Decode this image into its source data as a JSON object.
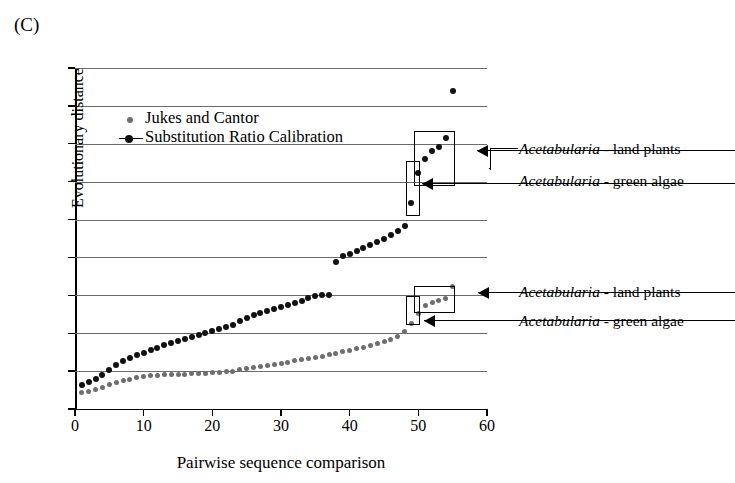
{
  "panel_label": "(C)",
  "legend": {
    "items": [
      {
        "label": "Jukes and Cantor",
        "color": "#6e6e6e",
        "marker": "small-gray-dot"
      },
      {
        "label": "Substitution Ratio Calibration",
        "color": "#111111",
        "marker": "black-dot-with-line"
      }
    ]
  },
  "annotations": [
    {
      "genus": "Acetabularia",
      "rest": " - land plants",
      "group": "upper"
    },
    {
      "genus": "Acetabularia",
      "rest": " - green algae",
      "group": "upper"
    },
    {
      "genus": "Acetabularia",
      "rest": " - land plants",
      "group": "lower"
    },
    {
      "genus": "Acetabularia",
      "rest": " - green algae",
      "group": "lower"
    }
  ],
  "chart_data": {
    "type": "scatter",
    "title": "",
    "xlabel": "Pairwise sequence comparison",
    "ylabel": "Evolutionary distance",
    "xlim": [
      0,
      60
    ],
    "ylim": [
      0,
      0.9
    ],
    "xticks": [
      0,
      10,
      20,
      30,
      40,
      50,
      60
    ],
    "xtick_labels": [
      "0",
      "10",
      "20",
      "30",
      "40",
      "50",
      "60"
    ],
    "yticks": [
      0,
      0.1,
      0.2,
      0.3,
      0.4,
      0.5,
      0.6,
      0.7,
      0.8,
      0.9
    ],
    "ytick_labels": [
      "0",
      "0.1",
      "0.2",
      "0.3",
      "0.4",
      "0.5",
      "0.6",
      "0.7",
      "0.8",
      "0.9"
    ],
    "grid": "horizontal",
    "legend_position": "upper-left-inside",
    "series": [
      {
        "name": "Jukes and Cantor",
        "color": "#6e6e6e",
        "marker_size": 5,
        "x": [
          1,
          2,
          3,
          4,
          5,
          6,
          7,
          8,
          9,
          10,
          11,
          12,
          13,
          14,
          15,
          16,
          17,
          18,
          19,
          20,
          21,
          22,
          23,
          24,
          25,
          26,
          27,
          28,
          29,
          30,
          31,
          32,
          33,
          34,
          35,
          36,
          37,
          38,
          39,
          40,
          41,
          42,
          43,
          44,
          45,
          46,
          47,
          48,
          49,
          50,
          51,
          52,
          53,
          54,
          55
        ],
        "y": [
          0.044,
          0.046,
          0.052,
          0.058,
          0.064,
          0.07,
          0.074,
          0.078,
          0.082,
          0.086,
          0.088,
          0.089,
          0.09,
          0.09,
          0.091,
          0.092,
          0.093,
          0.094,
          0.095,
          0.096,
          0.097,
          0.098,
          0.1,
          0.103,
          0.106,
          0.109,
          0.112,
          0.115,
          0.118,
          0.121,
          0.124,
          0.127,
          0.13,
          0.133,
          0.136,
          0.139,
          0.143,
          0.147,
          0.151,
          0.155,
          0.159,
          0.163,
          0.168,
          0.173,
          0.178,
          0.184,
          0.192,
          0.205,
          0.225,
          0.252,
          0.272,
          0.282,
          0.287,
          0.292,
          0.322
        ]
      },
      {
        "name": "Substitution Ratio Calibration",
        "color": "#111111",
        "marker_size": 6,
        "x": [
          1,
          2,
          3,
          4,
          5,
          6,
          7,
          8,
          9,
          10,
          11,
          12,
          13,
          14,
          15,
          16,
          17,
          18,
          19,
          20,
          21,
          22,
          23,
          24,
          25,
          26,
          27,
          28,
          29,
          30,
          31,
          32,
          33,
          34,
          35,
          36,
          37,
          38,
          39,
          40,
          41,
          42,
          43,
          44,
          45,
          46,
          47,
          48,
          49,
          50,
          51,
          52,
          53,
          54,
          55
        ],
        "y": [
          0.063,
          0.07,
          0.08,
          0.09,
          0.104,
          0.116,
          0.126,
          0.134,
          0.142,
          0.148,
          0.155,
          0.162,
          0.168,
          0.174,
          0.18,
          0.186,
          0.191,
          0.196,
          0.2,
          0.205,
          0.21,
          0.216,
          0.222,
          0.232,
          0.24,
          0.247,
          0.253,
          0.258,
          0.263,
          0.268,
          0.274,
          0.28,
          0.286,
          0.292,
          0.297,
          0.3,
          0.3,
          0.389,
          0.404,
          0.41,
          0.418,
          0.425,
          0.432,
          0.44,
          0.45,
          0.46,
          0.47,
          0.482,
          0.545,
          0.622,
          0.66,
          0.68,
          0.692,
          0.715,
          0.84
        ]
      }
    ],
    "highlight_boxes": [
      {
        "series": "Substitution Ratio Calibration",
        "x_range": [
          48.2,
          49.9
        ],
        "y_range": [
          0.515,
          0.655
        ],
        "label": "Acetabularia - green algae"
      },
      {
        "series": "Substitution Ratio Calibration",
        "x_range": [
          49.4,
          55.0
        ],
        "y_range": [
          0.595,
          0.735
        ],
        "label": "Acetabularia - land plants"
      },
      {
        "series": "Jukes and Cantor",
        "x_range": [
          48.2,
          49.9
        ],
        "y_range": [
          0.228,
          0.298
        ],
        "label": "Acetabularia - green algae"
      },
      {
        "series": "Jukes and Cantor",
        "x_range": [
          49.4,
          55.0
        ],
        "y_range": [
          0.258,
          0.325
        ],
        "label": "Acetabularia - land plants"
      }
    ]
  }
}
